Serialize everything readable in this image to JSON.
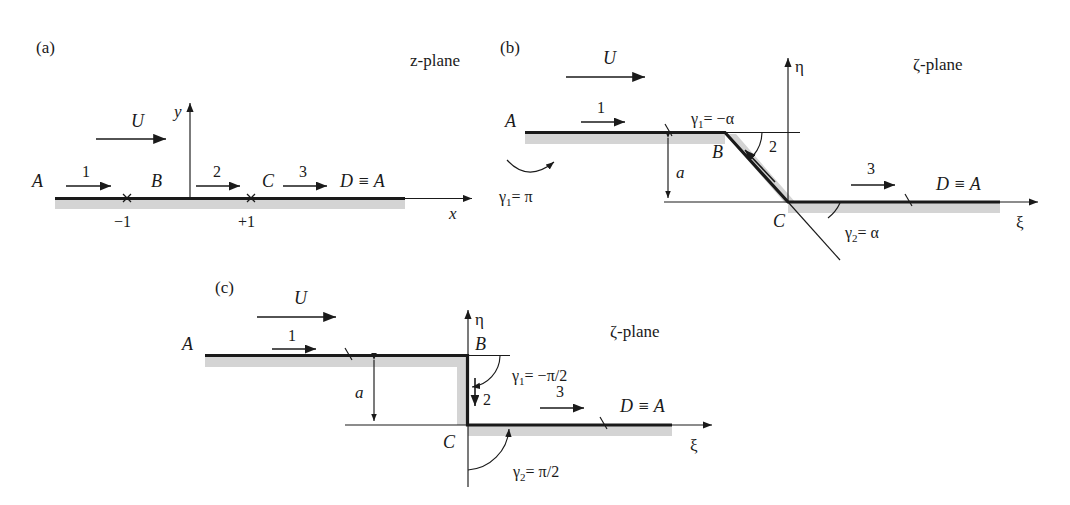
{
  "figure": {
    "background": "#ffffff",
    "ink": "#1a1a1a",
    "shade_color": "#d4d4d4"
  },
  "panels": [
    {
      "id": "a",
      "tag": "(a)",
      "plane_label": "z-plane",
      "flow_label": "U",
      "points": {
        "A": "A",
        "B": "B",
        "C": "C",
        "D": "D ≡ A"
      },
      "axes": {
        "x": "x",
        "y": "y"
      },
      "ticks": [
        {
          "label": "−1",
          "at": "B"
        },
        {
          "label": "+1",
          "at": "C"
        }
      ],
      "segments": [
        {
          "label": "1"
        },
        {
          "label": "2"
        },
        {
          "label": "3"
        }
      ]
    },
    {
      "id": "b",
      "tag": "(b)",
      "plane_label": "ζ-plane",
      "flow_label": "U",
      "points": {
        "A": "A",
        "B": "B",
        "C": "C",
        "D": "D ≡ A"
      },
      "axes": {
        "x": "ξ",
        "y": "η"
      },
      "dimension_label": "a",
      "segments": [
        {
          "label": "1"
        },
        {
          "label": "2"
        },
        {
          "label": "3"
        }
      ],
      "angles": [
        {
          "symbol": "γ",
          "sub": "1",
          "eq": "= −α",
          "name": "gamma1-neg-alpha"
        },
        {
          "symbol": "γ",
          "sub": "2",
          "eq": "= α",
          "name": "gamma2-alpha"
        },
        {
          "symbol": "γ",
          "sub": "1",
          "eq": "= π",
          "name": "gamma1-pi"
        }
      ]
    },
    {
      "id": "c",
      "tag": "(c)",
      "plane_label": "ζ-plane",
      "flow_label": "U",
      "points": {
        "A": "A",
        "B": "B",
        "C": "C",
        "D": "D ≡ A"
      },
      "axes": {
        "x": "ξ",
        "y": "η"
      },
      "dimension_label": "a",
      "segments": [
        {
          "label": "1"
        },
        {
          "label": "2"
        },
        {
          "label": "3"
        }
      ],
      "angles": [
        {
          "symbol": "γ",
          "sub": "1",
          "eq": "= −π/2",
          "name": "gamma1-neg-pi-over-2"
        },
        {
          "symbol": "γ",
          "sub": "2",
          "eq": "= π/2",
          "name": "gamma2-pi-over-2"
        }
      ]
    }
  ]
}
